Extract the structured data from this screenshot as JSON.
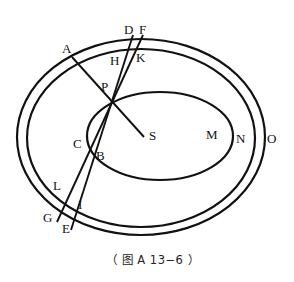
{
  "figure": {
    "caption": "（ 图 A 13−6 ）",
    "labels": {
      "A": "A",
      "D": "D",
      "F": "F",
      "H": "H",
      "K": "K",
      "P": "P",
      "C": "C",
      "B": "B",
      "S": "S",
      "M": "M",
      "N": "N",
      "O": "O",
      "L": "L",
      "G": "G",
      "I": "I",
      "E": "E"
    },
    "colors": {
      "stroke": "#111111",
      "background": "#ffffff"
    }
  }
}
